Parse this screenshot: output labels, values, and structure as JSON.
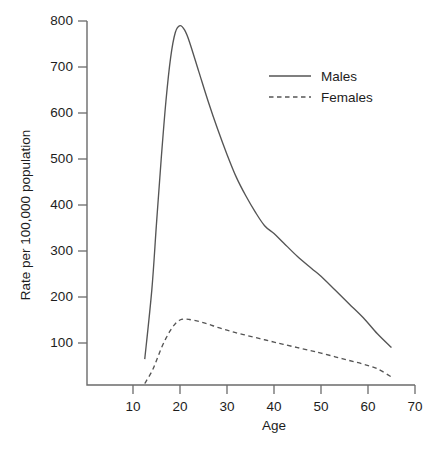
{
  "chart_data": {
    "type": "line",
    "title": "",
    "xlabel": "Age",
    "ylabel": "Rate per 100,000 population",
    "xlim": [
      5,
      70
    ],
    "ylim": [
      0,
      800
    ],
    "xticks": [
      10,
      20,
      30,
      40,
      50,
      60,
      70
    ],
    "xtick_labels": [
      "10",
      "20",
      "30",
      "40",
      "50",
      "60",
      "70"
    ],
    "yticks": [
      100,
      200,
      300,
      400,
      500,
      600,
      700,
      800
    ],
    "ytick_labels": [
      "100",
      "200",
      "300",
      "400",
      "500",
      "600",
      "700",
      "800"
    ],
    "grid": false,
    "legend_position": "upper right",
    "x": [
      12.5,
      14,
      15,
      16,
      17,
      18,
      19,
      20,
      21,
      22,
      24,
      26,
      28,
      30,
      32,
      34,
      36,
      38,
      40,
      42,
      45,
      48,
      50,
      53,
      56,
      59,
      62,
      65
    ],
    "series": [
      {
        "name": "Males",
        "style": "solid",
        "color": "#555555",
        "values": [
          65,
          215,
          360,
          500,
          625,
          720,
          775,
          790,
          780,
          755,
          690,
          625,
          565,
          510,
          460,
          420,
          385,
          355,
          338,
          318,
          288,
          262,
          245,
          215,
          185,
          155,
          120,
          90
        ]
      },
      {
        "name": "Females",
        "style": "dashed",
        "color": "#555555",
        "values": [
          12,
          38,
          62,
          88,
          110,
          128,
          142,
          150,
          152,
          151,
          147,
          141,
          134,
          128,
          122,
          117,
          112,
          107,
          102,
          97,
          90,
          83,
          78,
          70,
          62,
          54,
          44,
          26
        ]
      }
    ],
    "annotations": {
      "males_peak_age": 20,
      "males_peak_rate": 790,
      "females_peak_age": 21,
      "females_peak_rate": 152
    }
  },
  "legend": {
    "entries": [
      {
        "label": "Males",
        "style": "solid"
      },
      {
        "label": "Females",
        "style": "dashed"
      }
    ]
  }
}
